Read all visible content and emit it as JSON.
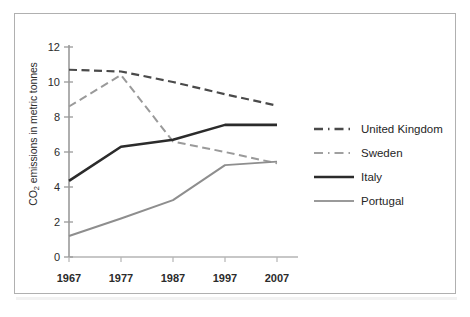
{
  "chart_data": {
    "type": "line",
    "title": "",
    "xlabel": "",
    "ylabel": "CO2 emissions in metric tonnes",
    "ylabel_prefix": "CO",
    "ylabel_sub": "2",
    "ylabel_suffix": " emissions in metric tonnes",
    "x": [
      "1967",
      "1977",
      "1987",
      "1997",
      "2007"
    ],
    "categories": [
      "1967",
      "1977",
      "1987",
      "1997",
      "2007"
    ],
    "xlim": [
      1967,
      2007
    ],
    "ylim": [
      0,
      12
    ],
    "yticks": [
      "12",
      "10",
      "8",
      "6",
      "4",
      "2",
      "0"
    ],
    "ytick_values": [
      12,
      10,
      8,
      6,
      4,
      2,
      0
    ],
    "grid": false,
    "legend_position": "right",
    "series": [
      {
        "name": "United Kingdom",
        "values": [
          10.7,
          10.6,
          10.0,
          9.3,
          8.65
        ],
        "color": "#4a4a4a",
        "style": "dashed",
        "width": 2.2
      },
      {
        "name": "Sweden",
        "values": [
          8.6,
          10.4,
          6.6,
          6.0,
          5.35
        ],
        "color": "#9a9a9a",
        "style": "dashed",
        "width": 2.0
      },
      {
        "name": "Italy",
        "values": [
          4.35,
          6.3,
          6.7,
          7.55,
          7.55
        ],
        "color": "#2b2b2b",
        "style": "solid",
        "width": 2.6
      },
      {
        "name": "Portugal",
        "values": [
          1.2,
          2.2,
          3.25,
          5.25,
          5.45
        ],
        "color": "#8e8e8e",
        "style": "solid",
        "width": 2.0
      }
    ]
  },
  "legend": {
    "items": [
      {
        "label": "United Kingdom"
      },
      {
        "label": "Sweden"
      },
      {
        "label": "Italy"
      },
      {
        "label": "Portugal"
      }
    ]
  },
  "axis": {
    "y_ticks": [
      "12",
      "10",
      "8",
      "6",
      "4",
      "2",
      "0"
    ],
    "x_ticks": [
      "1967",
      "1977",
      "1987",
      "1997",
      "2007"
    ]
  }
}
